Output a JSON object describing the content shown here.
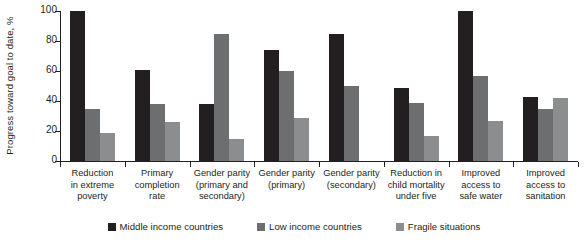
{
  "chart_data": {
    "type": "bar",
    "title": "",
    "xlabel": "",
    "ylabel": "Progress toward goal to date, %",
    "ylim": [
      0,
      100
    ],
    "yticks": [
      0,
      20,
      40,
      60,
      80,
      100
    ],
    "grid": false,
    "legend_position": "bottom",
    "categories": [
      "Reduction in extreme poverty",
      "Primary completion rate",
      "Gender parity (primary and secondary)",
      "Gender parity (primary)",
      "Gender parity (secondary)",
      "Reduction in child mortality under five",
      "Improved access to safe water",
      "Improved access to sanitation"
    ],
    "category_lines": [
      [
        "Reduction",
        "in extreme",
        "poverty"
      ],
      [
        "Primary",
        "completion",
        "rate"
      ],
      [
        "Gender parity",
        "(primary and",
        "secondary)"
      ],
      [
        "Gender parity",
        "(primary)"
      ],
      [
        "Gender parity",
        "(secondary)"
      ],
      [
        "Reduction in",
        "child mortality",
        "under five"
      ],
      [
        "Improved",
        "access to",
        "safe water"
      ],
      [
        "Improved",
        "access to",
        "sanitation"
      ]
    ],
    "series": [
      {
        "name": "Middle income countries",
        "color": "#231f20",
        "values": [
          100,
          61,
          38,
          74,
          85,
          49,
          100,
          43
        ]
      },
      {
        "name": "Low income countries",
        "color": "#6d6e70",
        "values": [
          35,
          38,
          85,
          60,
          50,
          39,
          57,
          35
        ]
      },
      {
        "name": "Fragile situations",
        "color": "#8c8d8f",
        "values": [
          19,
          26,
          15,
          29,
          null,
          17,
          27,
          42
        ]
      }
    ]
  },
  "legend": {
    "items": [
      {
        "label": "Middle income countries",
        "color": "#231f20"
      },
      {
        "label": "Low income countries",
        "color": "#6d6e70"
      },
      {
        "label": "Fragile situations",
        "color": "#8c8d8f"
      }
    ]
  }
}
